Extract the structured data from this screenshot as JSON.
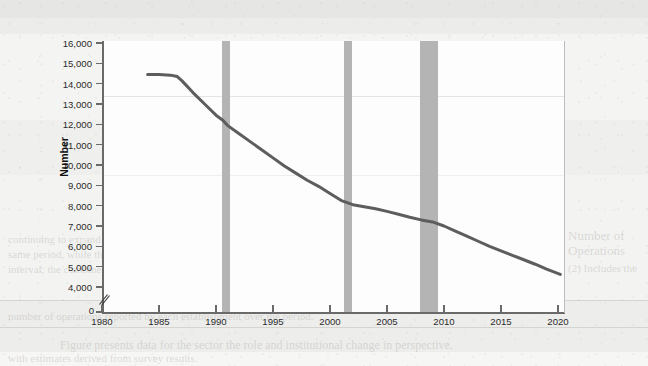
{
  "figure": {
    "axis_title_y": "Number",
    "line_color": "#5d5d5d",
    "band_color": "#b4b4b4",
    "plot_background": "#fdfdfd"
  },
  "ghost_text": {
    "title": "RECESSIONS",
    "l1": "continuing to expand rapidly from about 1 per 2,000 in 1980 to about 1 per 1,000 in the",
    "l2": "same period, while the number of establishments declined sharply over the same",
    "l3": "interval; the combined effect is shown in the figure above.",
    "l4": "Number of",
    "l5": "Operations",
    "l6": "(2) Includes the",
    "l7": "number of operations reported by each establishment over the period.",
    "l8": "Figure presents data for the sector the role and institutional change in perspective.",
    "l9": "with estimates derived from survey results."
  },
  "chart_data": {
    "type": "line",
    "title": "",
    "xlabel": "",
    "ylabel": "Number",
    "xlim": [
      1980,
      2020
    ],
    "ylim": [
      4000,
      16000
    ],
    "y_axis_break": true,
    "y_break_label": "0",
    "grid": false,
    "legend": "none",
    "x_ticks": [
      1980,
      1985,
      1990,
      1995,
      2000,
      2005,
      2010,
      2015,
      2020
    ],
    "x_tick_labels": [
      "1980",
      "1985",
      "1990",
      "1995",
      "2000",
      "2005",
      "2010",
      "2015",
      "2020"
    ],
    "y_ticks": [
      4000,
      5000,
      6000,
      7000,
      8000,
      9000,
      10000,
      11000,
      12000,
      13000,
      14000,
      15000,
      16000
    ],
    "y_tick_labels": [
      "4,000",
      "5,000",
      "6,000",
      "7,000",
      "8,000",
      "9,000",
      "10,000",
      "11,000",
      "12,000",
      "13,000",
      "14,000",
      "15,000",
      "16,000"
    ],
    "series": [
      {
        "name": "Number",
        "color": "#5d5d5d",
        "x": [
          1984.0,
          1985.0,
          1986.0,
          1986.6,
          1987.0,
          1988.0,
          1989.0,
          1990.0,
          1990.6,
          1991.0,
          1992.0,
          1993.0,
          1994.0,
          1995.0,
          1996.0,
          1997.0,
          1998.0,
          1999.0,
          2000.0,
          2001.0,
          2002.0,
          2003.0,
          2004.0,
          2005.0,
          2006.0,
          2007.0,
          2008.0,
          2009.0,
          2010.0,
          2011.0,
          2012.0,
          2013.0,
          2014.0,
          2015.0,
          2016.0,
          2017.0,
          2018.0,
          2019.0,
          2020.2
        ],
        "y": [
          14450,
          14450,
          14420,
          14350,
          14150,
          13550,
          13000,
          12450,
          12200,
          11950,
          11550,
          11150,
          10750,
          10350,
          9950,
          9600,
          9250,
          8950,
          8600,
          8250,
          8050,
          7950,
          7850,
          7720,
          7580,
          7430,
          7300,
          7200,
          7000,
          6750,
          6500,
          6250,
          6000,
          5780,
          5560,
          5340,
          5120,
          4880,
          4620
        ]
      }
    ],
    "shaded_regions": [
      {
        "label": "recession",
        "x0": 1990.55,
        "x1": 1991.25,
        "color": "#b4b4b4"
      },
      {
        "label": "recession",
        "x0": 2001.2,
        "x1": 2001.9,
        "color": "#b4b4b4"
      },
      {
        "label": "recession",
        "x0": 2007.9,
        "x1": 2009.5,
        "color": "#b4b4b4"
      }
    ]
  }
}
